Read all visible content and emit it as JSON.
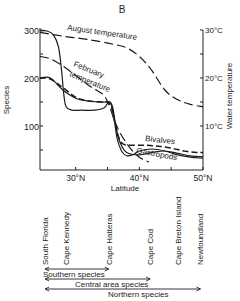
{
  "chart_data": {
    "type": "line",
    "panel_label": "B",
    "title": "",
    "xlabel": "Latitude",
    "ylabel": "Species",
    "y2label": "Water temperature",
    "xlim": [
      24.4,
      50
    ],
    "ylim": [
      0,
      300
    ],
    "y2lim": [
      0,
      30
    ],
    "x_ticks": [
      {
        "value": 30,
        "label": "30°N"
      },
      {
        "value": 35,
        "label": ""
      },
      {
        "value": 40,
        "label": "40°N"
      },
      {
        "value": 45,
        "label": ""
      },
      {
        "value": 50,
        "label": "50°N"
      }
    ],
    "y_ticks": [
      {
        "value": 300,
        "label": "300"
      },
      {
        "value": 250,
        "label": ""
      },
      {
        "value": 200,
        "label": "200"
      },
      {
        "value": 150,
        "label": ""
      },
      {
        "value": 100,
        "label": "100"
      },
      {
        "value": 50,
        "label": ""
      }
    ],
    "y2_ticks": [
      {
        "value": 30,
        "label": "30°C"
      },
      {
        "value": 25,
        "label": ""
      },
      {
        "value": 20,
        "label": "20°C"
      },
      {
        "value": 15,
        "label": ""
      },
      {
        "value": 10,
        "label": "10°C"
      }
    ],
    "grid": false,
    "series": [
      {
        "name": "Total species",
        "axis": "left",
        "style": "solid",
        "label": "",
        "x": [
          24.4,
          25.5,
          26.5,
          27.3,
          27.8,
          28.1,
          28.5,
          29.5,
          31,
          33,
          34.5,
          35.2,
          35.8,
          36.3,
          37,
          38,
          40,
          42,
          44,
          46,
          48,
          50
        ],
        "y": [
          298,
          298,
          290,
          265,
          215,
          170,
          140,
          133,
          133,
          133,
          138,
          150,
          140,
          100,
          65,
          45,
          40,
          45,
          48,
          43,
          38,
          36
        ]
      },
      {
        "name": "Bivalves",
        "axis": "left",
        "style": "dashed",
        "label": "Bivalves",
        "x": [
          24.4,
          26,
          28,
          30,
          32,
          34,
          35,
          35.6,
          36.1,
          36.8,
          37.5,
          39,
          41,
          43,
          45,
          47,
          49,
          50
        ],
        "y": [
          200,
          198,
          180,
          160,
          152,
          150,
          150,
          140,
          110,
          75,
          62,
          60,
          60,
          58,
          54,
          48,
          45,
          45
        ]
      },
      {
        "name": "Gastropods",
        "axis": "left",
        "style": "solid",
        "label": "Gastropods",
        "x": [
          24.4,
          26,
          28,
          30,
          32,
          34,
          35,
          35.5,
          36,
          36.5,
          37.2,
          38,
          39,
          40,
          42,
          44,
          46,
          48,
          50
        ],
        "y": [
          200,
          200,
          175,
          158,
          152,
          150,
          150,
          148,
          120,
          75,
          48,
          38,
          40,
          48,
          52,
          48,
          40,
          35,
          33
        ]
      },
      {
        "name": "August temperature",
        "axis": "right",
        "style": "dashed",
        "label": "August temperature",
        "x": [
          24.4,
          28,
          32,
          36,
          38,
          40,
          42,
          44,
          46,
          48,
          50
        ],
        "y": [
          29.5,
          28.7,
          28.0,
          27.0,
          26.3,
          24.5,
          21.5,
          17.5,
          15.5,
          14.5,
          14.0
        ]
      },
      {
        "name": "February temperature",
        "axis": "right",
        "style": "dashed",
        "label": "February temperature",
        "x": [
          24.4,
          26,
          28,
          30,
          32,
          33.5,
          34.5,
          35.2,
          36,
          37,
          38.5,
          40,
          41.5
        ],
        "y": [
          24.5,
          24.0,
          22.5,
          20.5,
          18.5,
          17.3,
          16.3,
          14.5,
          11.5,
          8.5,
          5.5,
          3.5,
          2.5
        ]
      }
    ],
    "locations": [
      {
        "name": "South Florida",
        "lat": 25.2
      },
      {
        "name": "Cape Kennedy",
        "lat": 28.5
      },
      {
        "name": "Cape Hatteras",
        "lat": 35.2
      },
      {
        "name": "Cape Cod",
        "lat": 41.7
      },
      {
        "name": "Cape Breton Island",
        "lat": 46.0
      },
      {
        "name": "Newfoundland",
        "lat": 49.6
      }
    ],
    "ranges": [
      {
        "name": "Southern species",
        "from": "South Florida",
        "to": "Cape Hatteras",
        "x_from": 25.2,
        "x_to": 35.2
      },
      {
        "name": "Central area species",
        "from": "South Florida",
        "to": "Cape Cod",
        "x_from": 25.2,
        "x_to": 41.7
      },
      {
        "name": "Northern species",
        "from": "South Florida",
        "to": "Newfoundland",
        "x_from": 25.2,
        "x_to": 49.6
      }
    ]
  }
}
